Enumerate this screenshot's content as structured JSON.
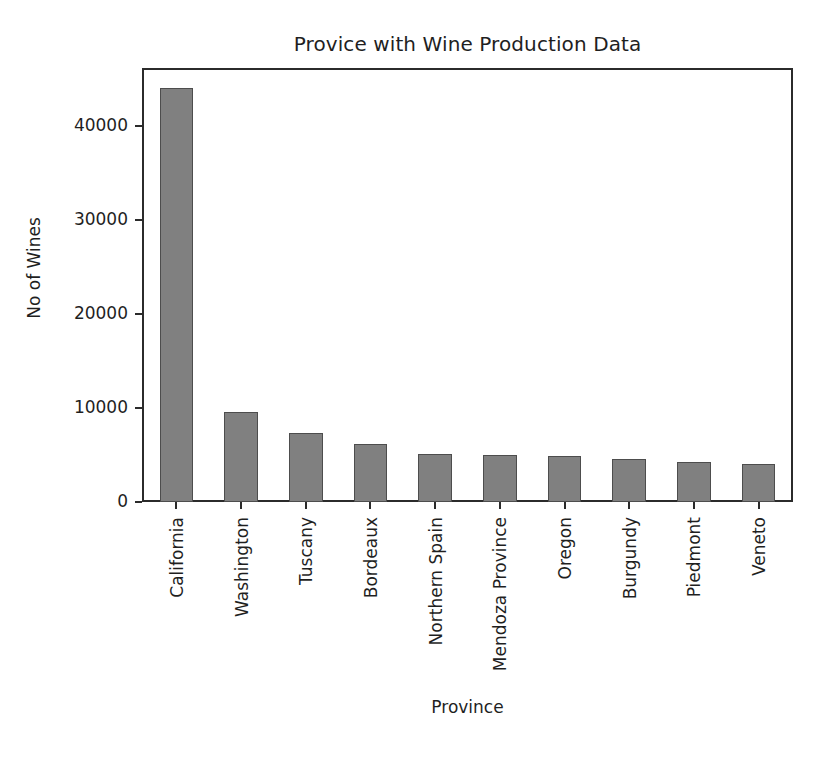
{
  "figure": {
    "title": "Provice with Wine Production Data",
    "background_color": "#ffffff",
    "frame_color": "#2b2b2b"
  },
  "scan_artifact": {
    "present": "true",
    "description": "faint horizontal scan line near top edge"
  },
  "chart_data": {
    "type": "bar",
    "title": "Provice with Wine Production Data",
    "xlabel": "Province",
    "ylabel": "No of Wines",
    "categories": [
      "California",
      "Washington",
      "Tuscany",
      "Bordeaux",
      "Northern Spain",
      "Mendoza Province",
      "Oregon",
      "Burgundy",
      "Piedmont",
      "Veneto"
    ],
    "values": [
      44100,
      9600,
      7400,
      6200,
      5100,
      5000,
      4850,
      4540,
      4300,
      4100
    ],
    "ylim": [
      0,
      46000
    ],
    "yticks": [
      0,
      10000,
      20000,
      30000,
      40000
    ],
    "ytick_labels": [
      "0",
      "10000",
      "20000",
      "30000",
      "40000"
    ],
    "bar_color": "#808080",
    "bar_edge_color": "#4d4d4d",
    "grid": "off",
    "legend": "none",
    "xtick_rotation": "90"
  }
}
